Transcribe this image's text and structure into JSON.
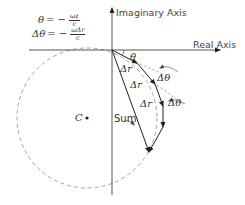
{
  "diagram": {
    "axes": {
      "imaginary_label": "Imaginary Axis",
      "real_label": "Real Axis"
    },
    "equations": [
      {
        "lhs": "θ",
        "op": "= −",
        "num": "ωz",
        "den": "c"
      },
      {
        "lhs": "Δθ",
        "op": "= −",
        "num": "ωΔr",
        "den": "c"
      }
    ],
    "labels": {
      "theta": "θ",
      "delta_r_1": "Δr",
      "delta_r_2": "Δr",
      "delta_r_3": "Δr",
      "delta_theta_1": "Δθ",
      "delta_theta_2": "Δθ",
      "sum": "Sum",
      "center": "C"
    },
    "colors": {
      "axis": "#555555",
      "vector": "#222222",
      "circle": "#999999",
      "text": "#333333"
    }
  }
}
